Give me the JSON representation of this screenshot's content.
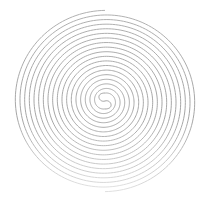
{
  "figure": {
    "kind": "double-spiral",
    "background": "#ffffff",
    "stroke_color": "#9c9c9c",
    "stroke_color_faded": "#d8d8d8",
    "center": [
      105,
      101
    ],
    "outer_radius": 92,
    "inner_radius": 8,
    "turns": 9,
    "stroke_width": 0.9
  }
}
